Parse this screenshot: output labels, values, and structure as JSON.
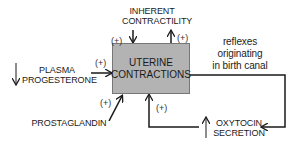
{
  "diagram": {
    "center": {
      "line1": "UTERINE",
      "line2": "CONTRACTIONS",
      "fill": "#b3b3b3"
    },
    "inherent": {
      "line1": "INHERENT",
      "line2": "CONTRACTILITY"
    },
    "plasma": {
      "line1": "PLASMA",
      "line2": "PROGESTERONE",
      "indicator": "↓"
    },
    "prostaglandin": {
      "label": "PROSTAGLANDIN"
    },
    "reflexes": {
      "line1": "reflexes",
      "line2": "originating",
      "line3": "in birth canal"
    },
    "oxytocin": {
      "line1": "OXYTOCIN",
      "line2": "SECRETION",
      "indicator": "↑"
    },
    "signs": {
      "inherent_in": "(+)",
      "inherent_out": "(+)",
      "plasma": "(+)",
      "prostaglandin": "(+)",
      "oxytocin": "(+)"
    }
  }
}
